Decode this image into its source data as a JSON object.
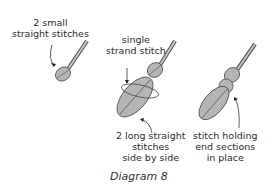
{
  "diagram": {
    "caption": "Diagram 8",
    "labels": {
      "small_stitches": [
        "2 small",
        "straight stitches"
      ],
      "single_strand": [
        "single",
        "strand stitch"
      ],
      "long_stitches": [
        "2 long straight",
        "stitches",
        "side by side"
      ],
      "holding_stitch": [
        "stitch holding",
        "end sections",
        "in place"
      ]
    },
    "colors": {
      "fill": "#b5b5b5",
      "stroke": "#4a4a4a",
      "text": "#2b2b2b"
    }
  }
}
